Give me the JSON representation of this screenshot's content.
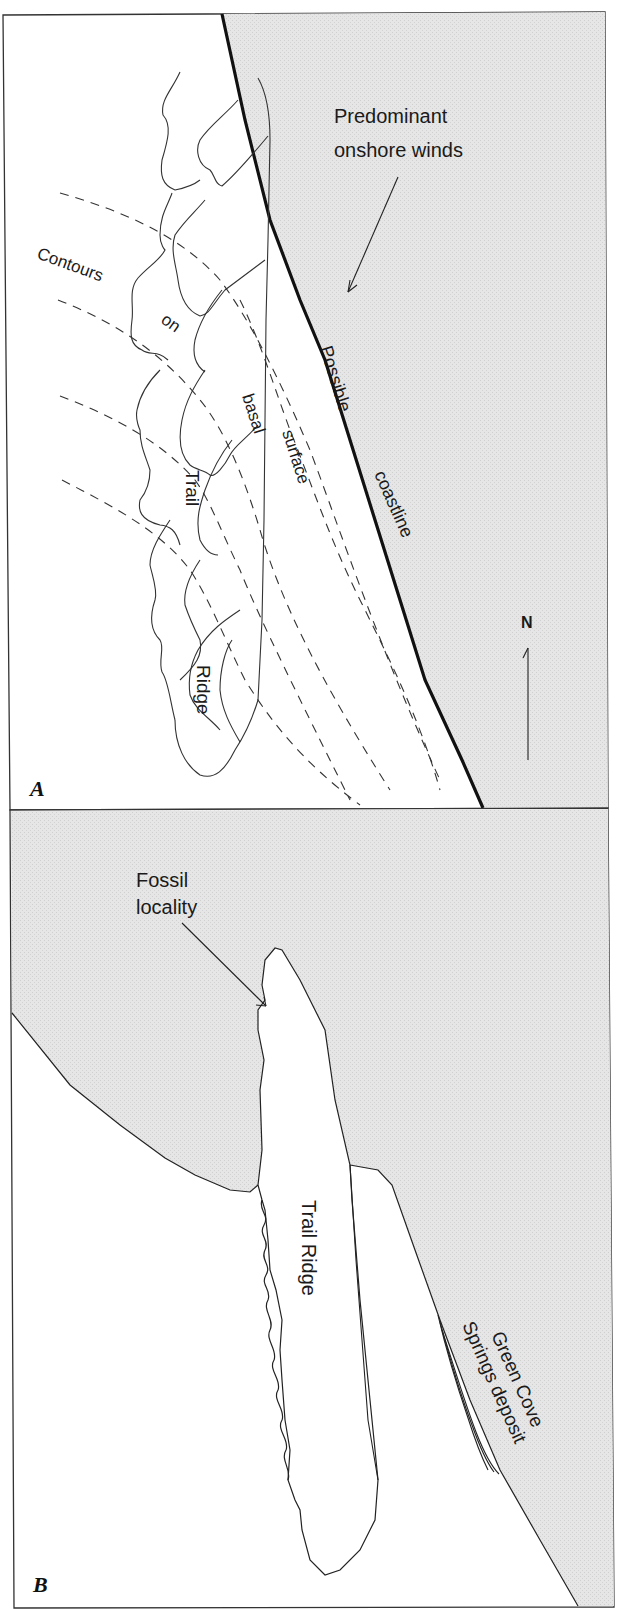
{
  "colors": {
    "land_fill": "#ffffff",
    "sea_fill": "#e3e3e3",
    "line": "#222222",
    "frame": "#333333"
  },
  "panel_a": {
    "letter": "A",
    "winds_label_line1": "Predominant",
    "winds_label_line2": "onshore winds",
    "contour_words": [
      "Contours",
      "on",
      "basal",
      "surface"
    ],
    "coast_words": [
      "Possible",
      "coastline"
    ],
    "ridge_words": [
      "Trail",
      "Ridge"
    ],
    "north_label": "N"
  },
  "panel_b": {
    "letter": "B",
    "fossil_label_line1": "Fossil",
    "fossil_label_line2": "locality",
    "ridge_label": "Trail Ridge",
    "deposit_label_line1": "Green Cove",
    "deposit_label_line2": "Springs deposit"
  }
}
